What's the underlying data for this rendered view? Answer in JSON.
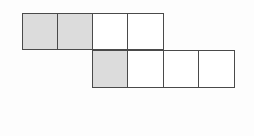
{
  "figure": {
    "background_color": "#fdfdfd",
    "stroke_color": "#4a4a4a",
    "shaded_color": "#dcdcdc",
    "unshaded_color": "#ffffff",
    "grid": {
      "columns": 6,
      "rows": 2,
      "cell_width_px": 36,
      "cell_height_px": 37
    },
    "rows": [
      {
        "name": "top-row",
        "row_index": 0,
        "start_column": 0,
        "cells": [
          {
            "column": 0,
            "shaded": true,
            "fill": "#dcdcdc",
            "label": ""
          },
          {
            "column": 1,
            "shaded": true,
            "fill": "#dcdcdc",
            "label": ""
          },
          {
            "column": 2,
            "shaded": false,
            "fill": "#ffffff",
            "label": ""
          },
          {
            "column": 3,
            "shaded": false,
            "fill": "#ffffff",
            "label": ""
          }
        ]
      },
      {
        "name": "bottom-row",
        "row_index": 1,
        "start_column": 2,
        "cells": [
          {
            "column": 2,
            "shaded": true,
            "fill": "#dcdcdc",
            "label": ""
          },
          {
            "column": 3,
            "shaded": false,
            "fill": "#ffffff",
            "label": ""
          },
          {
            "column": 4,
            "shaded": false,
            "fill": "#ffffff",
            "label": ""
          },
          {
            "column": 5,
            "shaded": false,
            "fill": "#ffffff",
            "label": ""
          }
        ]
      }
    ],
    "totals": {
      "total_squares": 8,
      "shaded_squares": 3,
      "unshaded_squares": 5
    }
  }
}
